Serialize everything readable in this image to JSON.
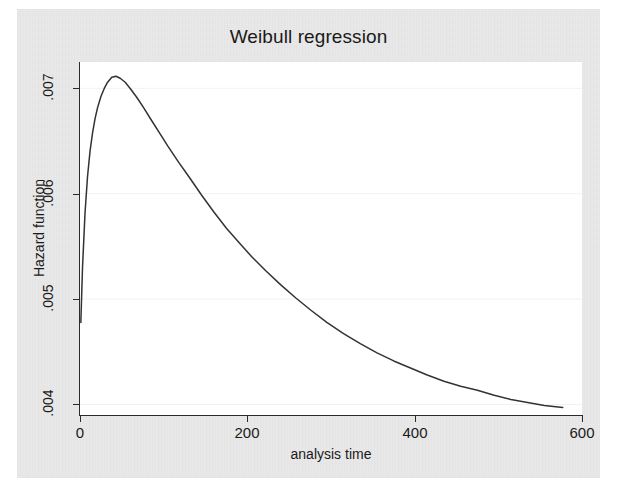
{
  "chart_data": {
    "type": "line",
    "title": "Weibull regression",
    "xlabel": "analysis time",
    "ylabel": "Hazard function",
    "xlim": [
      0,
      600
    ],
    "ylim": [
      0.0039,
      0.00725
    ],
    "grid": true,
    "legend": null,
    "x_ticks": [
      0,
      200,
      400,
      600
    ],
    "x_tick_labels": [
      "0",
      "200",
      "400",
      "600"
    ],
    "y_ticks": [
      0.004,
      0.005,
      0.006,
      0.007
    ],
    "y_tick_labels": [
      ".004",
      ".005",
      ".006",
      ".007"
    ],
    "series": [
      {
        "name": "Hazard function",
        "color": "#333333",
        "x": [
          1,
          3,
          6,
          9,
          12,
          15,
          18,
          21,
          25,
          29,
          33,
          38,
          43,
          48,
          54,
          60,
          68,
          76,
          85,
          95,
          105,
          118,
          130,
          145,
          160,
          175,
          190,
          205,
          222,
          240,
          258,
          276,
          295,
          315,
          335,
          355,
          375,
          395,
          415,
          435,
          455,
          475,
          495,
          515,
          535,
          555,
          577
        ],
        "y": [
          0.004779,
          0.005298,
          0.005817,
          0.006163,
          0.006404,
          0.006577,
          0.006712,
          0.006817,
          0.006923,
          0.006999,
          0.007058,
          0.007106,
          0.007115,
          0.007096,
          0.007058,
          0.006999,
          0.006913,
          0.006817,
          0.006702,
          0.006577,
          0.006452,
          0.006298,
          0.006163,
          0.00599,
          0.005827,
          0.005673,
          0.005538,
          0.005404,
          0.005269,
          0.005135,
          0.00501,
          0.004894,
          0.004779,
          0.004673,
          0.004577,
          0.00449,
          0.004413,
          0.004346,
          0.004279,
          0.004221,
          0.004173,
          0.004135,
          0.004087,
          0.004048,
          0.004019,
          0.00399,
          0.003971
        ]
      }
    ]
  }
}
